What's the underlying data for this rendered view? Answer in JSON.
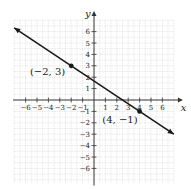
{
  "chart_data": {
    "type": "line",
    "title": "",
    "xlabel": "x",
    "ylabel": "y",
    "xlim": [
      -7,
      7
    ],
    "ylim": [
      -7,
      7
    ],
    "grid": true,
    "x_ticks": [
      -6,
      -5,
      -4,
      -3,
      -2,
      -1,
      1,
      2,
      3,
      4,
      5,
      6
    ],
    "y_ticks": [
      -6,
      -5,
      -4,
      -3,
      -2,
      -1,
      1,
      2,
      3,
      4,
      5,
      6
    ],
    "x_tick_labels": [
      "−6",
      "−5",
      "−4",
      "−3",
      "−2",
      "−1",
      "1",
      "2",
      "3",
      "4",
      "5",
      "6"
    ],
    "y_tick_labels": [
      "−6",
      "−5",
      "−4",
      "−3",
      "−2",
      "−1",
      "1",
      "2",
      "3",
      "4",
      "5",
      "6"
    ],
    "series": [
      {
        "name": "line through (−2, 3) and (4, −1)",
        "equation": "y = -2/3 x + 5/3",
        "x": [
          -7,
          7
        ],
        "y": [
          6.33,
          -3
        ]
      }
    ],
    "points": [
      {
        "x": -2,
        "y": 3,
        "label": "(−2, 3)"
      },
      {
        "x": 4,
        "y": -1,
        "label": "(4, −1)"
      }
    ]
  },
  "colors": {
    "line": "#1a1a1a",
    "axis": "#333333",
    "grid": "#d9d9d9",
    "text": "#222222"
  }
}
